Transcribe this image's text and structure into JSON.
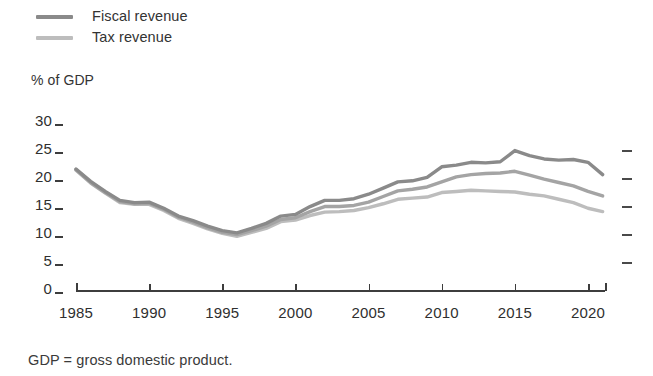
{
  "legend": {
    "items": [
      {
        "label": "Fiscal revenue",
        "color": "#8a8a8a"
      },
      {
        "label": "Tax revenue",
        "color": "#bdbdbd"
      }
    ]
  },
  "axis_unit_label": "% of GDP",
  "footnote": "GDP = gross domestic product.",
  "axes": {
    "y_ticks": [
      "30",
      "25",
      "20",
      "15",
      "10",
      "5",
      "0"
    ],
    "x_ticks": [
      "1985",
      "1990",
      "1995",
      "2000",
      "2005",
      "2010",
      "2015",
      "2020"
    ]
  },
  "chart_data": {
    "type": "line",
    "title": "",
    "subtitle": "",
    "xlabel": "",
    "ylabel": "% of GDP",
    "xlim": [
      1985,
      2021
    ],
    "ylim": [
      0,
      30
    ],
    "yticks": [
      0,
      5,
      10,
      15,
      20,
      25,
      30
    ],
    "xticks": [
      1985,
      1990,
      1995,
      2000,
      2005,
      2010,
      2015,
      2020
    ],
    "grid": false,
    "legend_position": "top-left",
    "annotations": [
      "GDP = gross domestic product."
    ],
    "x": [
      1985,
      1986,
      1987,
      1988,
      1989,
      1990,
      1991,
      1992,
      1993,
      1994,
      1995,
      1996,
      1997,
      1998,
      1999,
      2000,
      2001,
      2002,
      2003,
      2004,
      2005,
      2006,
      2007,
      2008,
      2009,
      2010,
      2011,
      2012,
      2013,
      2014,
      2015,
      2016,
      2017,
      2018,
      2019,
      2020,
      2021
    ],
    "series": [
      {
        "name": "Fiscal revenue",
        "color": "#8a8a8a",
        "values": [
          21.6,
          19.4,
          17.6,
          16.0,
          15.6,
          15.7,
          14.6,
          13.2,
          12.4,
          11.4,
          10.6,
          10.2,
          11.0,
          11.9,
          13.2,
          13.5,
          14.9,
          16.0,
          16.0,
          16.3,
          17.1,
          18.2,
          19.3,
          19.5,
          20.1,
          22.0,
          22.3,
          22.8,
          22.7,
          22.9,
          24.9,
          24.0,
          23.4,
          23.2,
          23.3,
          22.8,
          20.6
        ]
      },
      {
        "name": "Tax revenue",
        "color": "#bdbdbd",
        "values": [
          21.4,
          19.1,
          17.3,
          15.6,
          15.3,
          15.3,
          14.2,
          12.8,
          11.9,
          10.9,
          10.1,
          9.6,
          10.3,
          11.0,
          12.2,
          12.5,
          13.3,
          13.9,
          14.0,
          14.2,
          14.7,
          15.4,
          16.2,
          16.4,
          16.6,
          17.4,
          17.6,
          17.8,
          17.7,
          17.6,
          17.5,
          17.1,
          16.8,
          16.2,
          15.6,
          14.6,
          14.0
        ]
      },
      {
        "name": "",
        "color": "#a4a4a4",
        "values": [
          21.5,
          19.2,
          17.4,
          15.8,
          15.4,
          15.5,
          14.4,
          13.0,
          12.1,
          11.1,
          10.3,
          9.9,
          10.6,
          11.4,
          12.6,
          12.9,
          14.0,
          14.9,
          14.9,
          15.1,
          15.7,
          16.7,
          17.7,
          18.0,
          18.4,
          19.3,
          20.2,
          20.6,
          20.8,
          20.9,
          21.2,
          20.5,
          19.8,
          19.2,
          18.6,
          17.6,
          16.8
        ]
      }
    ]
  }
}
